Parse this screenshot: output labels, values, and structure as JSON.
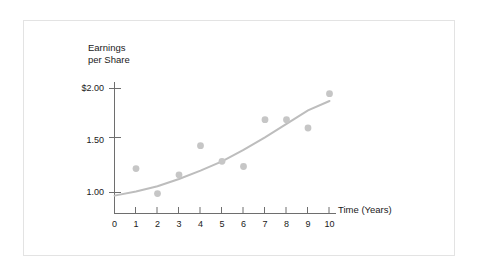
{
  "chart_data": {
    "type": "scatter",
    "title": "",
    "xlabel": "Time (Years)",
    "ylabel": "Earnings per Share",
    "ylabel_line1": "Earnings",
    "ylabel_line2": "per Share",
    "x": [
      1,
      2,
      3,
      4,
      5,
      6,
      7,
      8,
      9,
      10
    ],
    "values": [
      1.23,
      0.99,
      1.17,
      1.45,
      1.3,
      1.25,
      1.7,
      1.7,
      1.62,
      1.95
    ],
    "series": [
      {
        "name": "Earnings per Share",
        "values": [
          1.23,
          0.99,
          1.17,
          1.45,
          1.3,
          1.25,
          1.7,
          1.7,
          1.62,
          1.95
        ]
      },
      {
        "name": "Trend curve",
        "type": "line",
        "x": [
          0,
          1,
          2,
          3,
          4,
          5,
          6,
          7,
          8,
          9,
          10
        ],
        "values": [
          0.97,
          1.01,
          1.06,
          1.13,
          1.21,
          1.3,
          1.41,
          1.53,
          1.66,
          1.79,
          1.88
        ]
      }
    ],
    "xlim": [
      0,
      10
    ],
    "ylim": [
      0.85,
      2.1
    ],
    "xticks": [
      "0",
      "1",
      "2",
      "3",
      "4",
      "5",
      "6",
      "7",
      "8",
      "9",
      "10"
    ],
    "yticks": [
      "$2.00",
      "1.50",
      "1.00"
    ],
    "ytick_values": [
      2.0,
      1.5,
      1.0
    ],
    "grid": false,
    "legend": "none",
    "colors": {
      "marker": "#c6c6c6",
      "trend_line": "#bdbdbd",
      "axis": "#6e6e6e",
      "text": "#1a1a1a",
      "frame": "#e3e3e3",
      "background": "#ffffff"
    }
  }
}
